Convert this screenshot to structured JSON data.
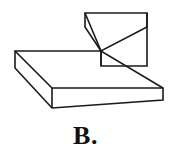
{
  "figure": {
    "caption": "B.",
    "alt_description": "Isometric line drawing of a small cube resting on the rear-right portion of a flat rectangular slab",
    "line_color": "#1a1a1a",
    "fill_color": "#ffffff",
    "background_color": "#ffffff",
    "stroke_width": 1.6,
    "objects": [
      {
        "name": "slab",
        "label": "rectangular base slab",
        "top_face_points": "15,51 101,51 163,88 52,88",
        "front_face_points": "52,88 163,88 163,100 52,108",
        "left_face_points": "15,51 52,88 52,108 15,68"
      },
      {
        "name": "cube",
        "label": "cube on top of slab",
        "top_face_points": "85,13 147,13 147,27 101,51",
        "front_face_points": "101,51 147,27 147,66 101,66",
        "left_face_points": "85,13 101,51 101,66 85,27"
      }
    ]
  }
}
